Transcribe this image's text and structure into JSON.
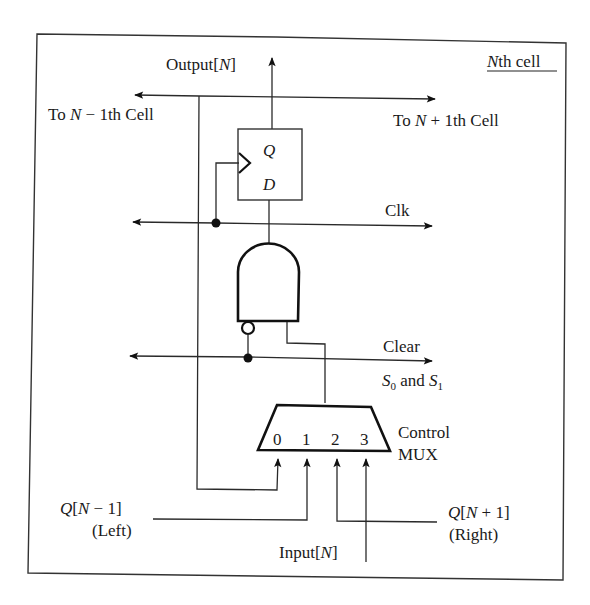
{
  "diagram": {
    "title": "Nth cell",
    "title_italic_part": "N",
    "title_rest": "th cell",
    "labels": {
      "output": {
        "prefix": "Output[",
        "var": "N",
        "suffix": "]"
      },
      "to_prev": {
        "prefix": "To ",
        "var": "N",
        "suffix": " − 1th Cell"
      },
      "to_next": {
        "prefix": "To ",
        "var": "N",
        "suffix": " + 1th Cell"
      },
      "ff_q": "Q",
      "ff_d": "D",
      "clk": "Clk",
      "clear": "Clear",
      "select": {
        "s0": "S",
        "s0_sub": "0",
        "and": " and ",
        "s1": "S",
        "s1_sub": "1"
      },
      "mux_inputs": [
        "0",
        "1",
        "2",
        "3"
      ],
      "mux_label_line1": "Control",
      "mux_label_line2": "MUX",
      "left_input": {
        "var": "Q",
        "prefix": "[",
        "nvar": "N",
        "suffix": " − 1]",
        "sub": "(Left)"
      },
      "right_input": {
        "var": "Q",
        "prefix": "[",
        "nvar": "N",
        "suffix": " + 1]",
        "sub": "(Right)"
      },
      "input": {
        "prefix": "Input[",
        "var": "N",
        "suffix": "]"
      }
    },
    "components": [
      "D flip-flop",
      "AND gate with inverted input",
      "4-to-1 control MUX"
    ]
  }
}
